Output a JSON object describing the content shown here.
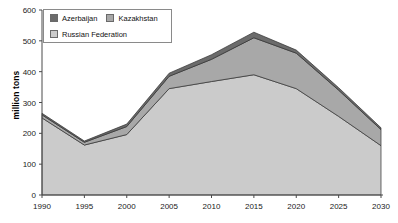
{
  "chart_data": {
    "type": "area",
    "stacked": true,
    "title": "",
    "xlabel": "",
    "ylabel": "million tons",
    "x": [
      1990,
      1995,
      2000,
      2005,
      2010,
      2015,
      2020,
      2025,
      2030
    ],
    "xticks": [
      1990,
      1995,
      2000,
      2005,
      2010,
      2015,
      2020,
      2025,
      2030
    ],
    "xlim": [
      1990,
      2030
    ],
    "yticks": [
      0,
      100,
      200,
      300,
      400,
      500,
      600
    ],
    "ylim": [
      0,
      600
    ],
    "grid": false,
    "legend_position": "top-left",
    "series": [
      {
        "name": "Russian Federation",
        "color": "#cbcbcb",
        "values": [
          250,
          162,
          196,
          345,
          368,
          390,
          345,
          255,
          160
        ]
      },
      {
        "name": "Kazakhstan",
        "color": "#a8a8a8",
        "values": [
          10,
          9,
          26,
          40,
          72,
          120,
          115,
          85,
          52
        ]
      },
      {
        "name": "Azerbaijan",
        "color": "#6b6b6b",
        "values": [
          5,
          4,
          8,
          10,
          15,
          18,
          10,
          8,
          6
        ]
      }
    ],
    "totals": [
      265,
      175,
      230,
      395,
      455,
      528,
      470,
      348,
      218
    ]
  },
  "legend": {
    "items": [
      {
        "label": "Azerbaijan",
        "color": "#6b6b6b"
      },
      {
        "label": "Kazakhstan",
        "color": "#a8a8a8"
      },
      {
        "label": "Russian Federation",
        "color": "#cbcbcb"
      }
    ]
  },
  "axis": {
    "y_title": "million tons"
  }
}
